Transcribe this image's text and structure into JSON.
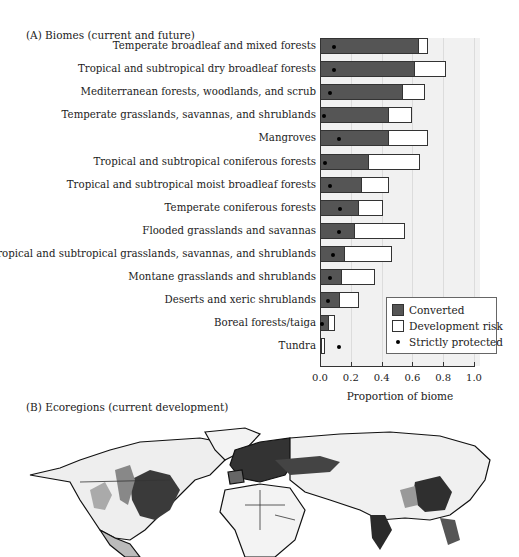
{
  "panel_a": {
    "title": "(A)  Biomes (current and future)"
  },
  "panel_b": {
    "title": "(B)  Ecoregions (current development)"
  },
  "chart_data": [
    {
      "type": "bar",
      "orientation": "horizontal",
      "stacked": true,
      "title": "(A) Biomes (current and future)",
      "xlabel": "Proportion of biome",
      "ylabel": "",
      "xlim": [
        0,
        1.0
      ],
      "xticks": [
        "0.0",
        "0.2",
        "0.4",
        "0.6",
        "0.8",
        "1.0"
      ],
      "grid": true,
      "legend_position": "lower right",
      "legend": [
        "Converted",
        "Development risk",
        "Strictly protected"
      ],
      "categories": [
        "Temperate broadleaf and mixed forests",
        "Tropical and subtropical dry broadleaf forests",
        "Mediterranean forests, woodlands, and scrub",
        "Temperate grasslands, savannas, and shrublands",
        "Mangroves",
        "Tropical and subtropical coniferous forests",
        "Tropical and subtropical moist broadleaf forests",
        "Temperate coniferous forests",
        "Flooded grasslands and savannas",
        "Tropical and subtropical grasslands, savannas, and shrublands",
        "Montane grasslands and shrublands",
        "Deserts and xeric shrublands",
        "Boreal forests/taiga",
        "Tundra"
      ],
      "series": [
        {
          "name": "Converted",
          "color": "#555555",
          "values": [
            0.64,
            0.62,
            0.54,
            0.45,
            0.45,
            0.32,
            0.27,
            0.25,
            0.23,
            0.16,
            0.14,
            0.13,
            0.06,
            0.01
          ]
        },
        {
          "name": "Development risk",
          "color": "#ffffff",
          "note": "cumulative end of bar (converted + risk)",
          "values": [
            0.7,
            0.82,
            0.68,
            0.6,
            0.7,
            0.65,
            0.45,
            0.41,
            0.55,
            0.47,
            0.36,
            0.25,
            0.1,
            0.03
          ]
        },
        {
          "name": "Strictly protected",
          "marker": "dot",
          "color": "#000000",
          "values": [
            0.08,
            0.08,
            0.05,
            0.01,
            0.11,
            0.02,
            0.05,
            0.12,
            0.11,
            0.07,
            0.05,
            0.04,
            0.0,
            0.11
          ]
        }
      ]
    },
    {
      "type": "map",
      "title": "(B) Ecoregions (current development)",
      "description": "Grayscale world map of ecoregions shaded by current development; darkest in eastern USA, Europe, India, eastern China"
    }
  ]
}
